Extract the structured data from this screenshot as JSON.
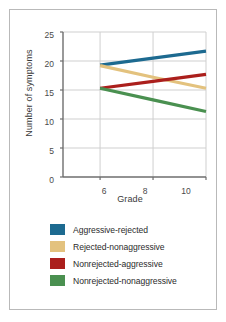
{
  "chart_data": {
    "type": "line",
    "title": "",
    "xlabel": "Grade",
    "ylabel": "Number of symptoms",
    "x": [
      6,
      8,
      10
    ],
    "xlim": [
      4.6,
      10
    ],
    "ylim": [
      0,
      25
    ],
    "xticks": [
      6,
      8,
      10
    ],
    "yticks": [
      0,
      5,
      10,
      15,
      20,
      25
    ],
    "grid": true,
    "legend_position": "bottom-left",
    "series": [
      {
        "name": "Aggressive-rejected",
        "color": "#1d6a90",
        "values": [
          19.3,
          20.5,
          21.7
        ]
      },
      {
        "name": "Rejected-nonaggressive",
        "color": "#e3c27e",
        "values": [
          19.2,
          17.2,
          15.3
        ]
      },
      {
        "name": "Nonrejected-aggressive",
        "color": "#ab1f1c",
        "values": [
          15.3,
          16.5,
          17.7
        ]
      },
      {
        "name": "Nonrejected-nonaggressive",
        "color": "#4a9050",
        "values": [
          15.3,
          13.3,
          11.3
        ]
      }
    ]
  },
  "axes": {
    "ylabel": "Number of symptoms",
    "xlabel": "Grade",
    "ytick_labels": [
      "25",
      "20",
      "15",
      "10",
      "5",
      "0"
    ],
    "xtick_labels": [
      "6",
      "8",
      "10"
    ]
  },
  "legend": {
    "items": [
      {
        "label": "Aggressive-rejected",
        "color": "#1d6a90"
      },
      {
        "label": "Rejected-nonaggressive",
        "color": "#e3c27e"
      },
      {
        "label": "Nonrejected-aggressive",
        "color": "#ab1f1c"
      },
      {
        "label": "Nonrejected-nonaggressive",
        "color": "#4a9050"
      }
    ]
  },
  "colors": {
    "axis": "#6e6e6e",
    "grid": "#cfcfcf",
    "border": "#b9b9b9",
    "text": "#3a3a3a",
    "background": "#ffffff"
  }
}
